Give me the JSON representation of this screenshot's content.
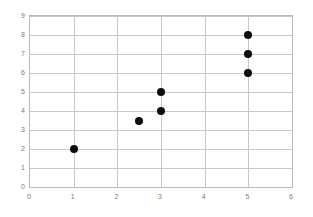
{
  "chart_data": {
    "type": "scatter",
    "title": "",
    "subtitle": "",
    "xlabel": "",
    "ylabel": "",
    "xlim": [
      0,
      6
    ],
    "ylim": [
      0,
      9
    ],
    "x_ticks": [
      "0",
      "1",
      "2",
      "3",
      "4",
      "5",
      "6"
    ],
    "y_ticks": [
      "0",
      "1",
      "2",
      "3",
      "4",
      "5",
      "6",
      "7",
      "8",
      "9"
    ],
    "x_tick_values": [
      0,
      1,
      2,
      3,
      4,
      5,
      6
    ],
    "y_tick_values": [
      0,
      1,
      2,
      3,
      4,
      5,
      6,
      7,
      8,
      9
    ],
    "grid": true,
    "grid_axis": "both",
    "legend": false,
    "legend_position": "none",
    "series": [
      {
        "name": "",
        "marker": "circle",
        "color": "#0d0d0d",
        "points": [
          {
            "x": 1,
            "y": 2
          },
          {
            "x": 2.5,
            "y": 3.5
          },
          {
            "x": 3,
            "y": 4
          },
          {
            "x": 3,
            "y": 5
          },
          {
            "x": 5,
            "y": 6
          },
          {
            "x": 5,
            "y": 7
          },
          {
            "x": 5,
            "y": 8
          }
        ]
      }
    ],
    "x": [
      1,
      2.5,
      3,
      3,
      5,
      5,
      5
    ],
    "values": [
      2,
      3.5,
      4,
      5,
      6,
      7,
      8
    ],
    "colors": {
      "marker": "#0d0d0d",
      "grid": "#c8c8c8",
      "frame": "#b9b9b9",
      "tick_label": "#7a7a7a",
      "background": "#ffffff"
    }
  }
}
